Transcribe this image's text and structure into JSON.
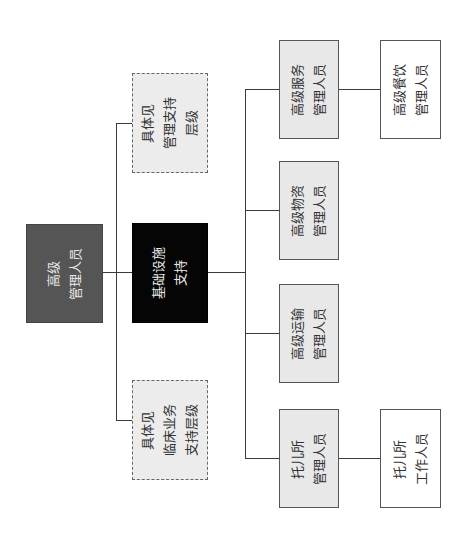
{
  "diagram": {
    "type": "org-chart",
    "orientation": "rotated -90deg",
    "nodes": {
      "root": {
        "lines": [
          "高级",
          "管理人员"
        ],
        "style": "dark-gray"
      },
      "infra": {
        "lines": [
          "基础设施",
          "支持"
        ],
        "style": "black"
      },
      "mgmt_support": {
        "lines": [
          "具体见",
          "管理支持",
          "层级"
        ],
        "style": "dashed"
      },
      "clinical_support": {
        "lines": [
          "具体见",
          "临床业务",
          "支持层级"
        ],
        "style": "dashed"
      },
      "service_mgr": {
        "lines": [
          "高级服务",
          "管理人员"
        ],
        "style": "gray"
      },
      "materials_mgr": {
        "lines": [
          "高级物资",
          "管理人员"
        ],
        "style": "gray"
      },
      "transport_mgr": {
        "lines": [
          "高级运输",
          "管理人员"
        ],
        "style": "gray"
      },
      "nursery_mgr": {
        "lines": [
          "托儿所",
          "管理人员"
        ],
        "style": "gray"
      },
      "catering_mgr": {
        "lines": [
          "高级餐饮",
          "管理人员"
        ],
        "style": "white"
      },
      "nursery_staff": {
        "lines": [
          "托儿所",
          "工作人员"
        ],
        "style": "white"
      }
    },
    "edges": [
      [
        "root",
        "infra"
      ],
      [
        "root",
        "mgmt_support"
      ],
      [
        "root",
        "clinical_support"
      ],
      [
        "infra",
        "service_mgr"
      ],
      [
        "infra",
        "materials_mgr"
      ],
      [
        "infra",
        "transport_mgr"
      ],
      [
        "infra",
        "nursery_mgr"
      ],
      [
        "service_mgr",
        "catering_mgr"
      ],
      [
        "nursery_mgr",
        "nursery_staff"
      ]
    ],
    "colors": {
      "root_fill": "#555555",
      "infra_fill": "#050505",
      "support_fill": "#ececec",
      "manager_fill": "#e8e8e8",
      "staff_fill": "#ffffff",
      "line": "#3a3a3a"
    }
  }
}
